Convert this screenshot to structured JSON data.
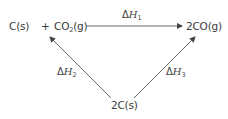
{
  "diagram": {
    "type": "hess-cycle",
    "nodes": {
      "reactants": {
        "part1": "C(s)",
        "plus": "+",
        "part2_main": "CO",
        "part2_sub": "2",
        "part2_state": "(g)"
      },
      "products": {
        "label": "2CO(g)"
      },
      "intermediate": {
        "label": "2C(s)"
      }
    },
    "edges": {
      "top": {
        "delta": "Δ",
        "symbol": "H",
        "sub": "1",
        "from": "reactants",
        "to": "products"
      },
      "left": {
        "delta": "Δ",
        "symbol": "H",
        "sub": "2",
        "from": "intermediate",
        "to": "reactants"
      },
      "right": {
        "delta": "Δ",
        "symbol": "H",
        "sub": "3",
        "from": "intermediate",
        "to": "products"
      }
    },
    "colors": {
      "text": "#3a3a3a",
      "arrow": "#555555",
      "background": "#ffffff"
    }
  }
}
